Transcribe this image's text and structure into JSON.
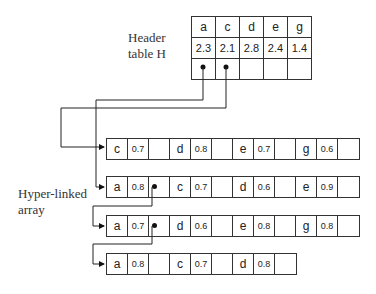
{
  "header_label": {
    "line1": "Header",
    "line2": "table H"
  },
  "array_label": {
    "line1": "Hyper-linked",
    "line2": "array"
  },
  "header_table": {
    "keys": [
      "a",
      "c",
      "d",
      "e",
      "g"
    ],
    "values": [
      "2.3",
      "2.1",
      "2.8",
      "2.4",
      "1.4"
    ]
  },
  "arrays": [
    {
      "entries": [
        {
          "k": "c",
          "v": "0.7"
        },
        {
          "k": "d",
          "v": "0.8"
        },
        {
          "k": "e",
          "v": "0.7"
        },
        {
          "k": "g",
          "v": "0.6"
        }
      ]
    },
    {
      "entries": [
        {
          "k": "a",
          "v": "0.8"
        },
        {
          "k": "c",
          "v": "0.7"
        },
        {
          "k": "d",
          "v": "0.6"
        },
        {
          "k": "e",
          "v": "0.9"
        }
      ]
    },
    {
      "entries": [
        {
          "k": "a",
          "v": "0.7"
        },
        {
          "k": "d",
          "v": "0.6"
        },
        {
          "k": "e",
          "v": "0.8"
        },
        {
          "k": "g",
          "v": "0.8"
        }
      ]
    },
    {
      "entries": [
        {
          "k": "a",
          "v": "0.8"
        },
        {
          "k": "c",
          "v": "0.7"
        },
        {
          "k": "d",
          "v": "0.8"
        }
      ]
    }
  ]
}
